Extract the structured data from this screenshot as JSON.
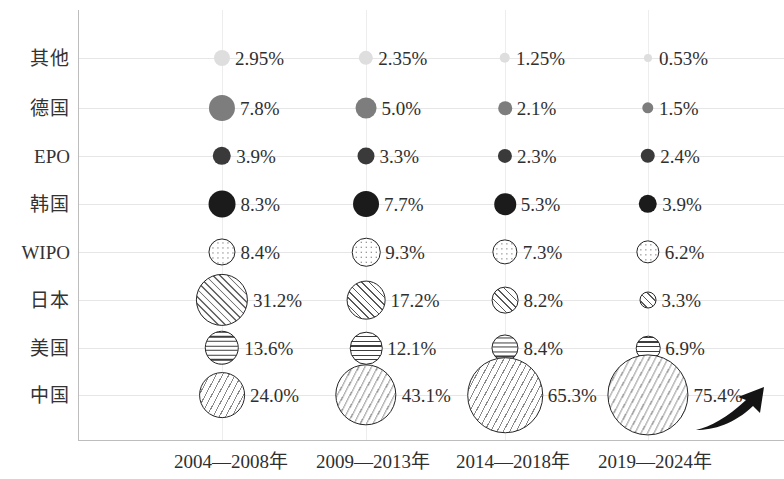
{
  "chart_data": {
    "type": "bubble",
    "title": "",
    "subtitle": "",
    "xlabel": "",
    "ylabel": "",
    "grid": true,
    "legend": "none",
    "note": "Bubble area is proportional to the share percentage; each row is a patent office / country, each column a time period.",
    "categories": [
      "2004—2008年",
      "2009—2013年",
      "2014—2018年",
      "2019—2024年"
    ],
    "rows": [
      "其他",
      "德国",
      "EPO",
      "韩国",
      "WIPO",
      "日本",
      "美国",
      "中国"
    ],
    "series": [
      {
        "name": "其他",
        "pattern": "solid-very-light",
        "color": "#dedede",
        "values": [
          2.95,
          2.35,
          1.25,
          0.53
        ],
        "labels": [
          "2.95%",
          "2.35%",
          "1.25%",
          "0.53%"
        ]
      },
      {
        "name": "德国",
        "pattern": "solid-gray",
        "color": "#7d7d7d",
        "values": [
          7.8,
          5.0,
          2.1,
          1.5
        ],
        "labels": [
          "7.8%",
          "5.0%",
          "2.1%",
          "1.5%"
        ]
      },
      {
        "name": "EPO",
        "pattern": "solid-dark",
        "color": "#3a3a3a",
        "values": [
          3.9,
          3.3,
          2.3,
          2.4
        ],
        "labels": [
          "3.9%",
          "3.3%",
          "2.3%",
          "2.4%"
        ]
      },
      {
        "name": "韩国",
        "pattern": "solid-black",
        "color": "#1b1b1b",
        "values": [
          8.3,
          7.7,
          5.3,
          3.9
        ],
        "labels": [
          "8.3%",
          "7.7%",
          "5.3%",
          "3.9%"
        ]
      },
      {
        "name": "WIPO",
        "pattern": "dots",
        "color": "#ffffff",
        "values": [
          8.4,
          9.3,
          7.3,
          6.2
        ],
        "labels": [
          "8.4%",
          "9.3%",
          "7.3%",
          "6.2%"
        ]
      },
      {
        "name": "日本",
        "pattern": "diagonal-hatch",
        "color": "#ffffff",
        "values": [
          31.2,
          17.2,
          8.2,
          3.3
        ],
        "labels": [
          "31.2%",
          "17.2%",
          "8.2%",
          "3.3%"
        ]
      },
      {
        "name": "美国",
        "pattern": "horizontal-lines",
        "color": "#ffffff",
        "values": [
          13.6,
          12.1,
          8.4,
          6.9
        ],
        "labels": [
          "13.6%",
          "12.1%",
          "8.4%",
          "6.9%"
        ]
      },
      {
        "name": "中国",
        "pattern": "dense-ticks",
        "color": "#ffffff",
        "values": [
          24.0,
          43.1,
          65.3,
          75.4
        ],
        "labels": [
          "24.0%",
          "43.1%",
          "65.3%",
          "75.4%"
        ]
      }
    ],
    "annotations": [
      {
        "name": "growth-arrow",
        "shape": "upward-curved-arrow",
        "color": "#1a1a1a"
      }
    ],
    "colors": {
      "gridline": "#e6e6e6",
      "axis": "#bdbdbd",
      "text": "#2f2f2f",
      "bubble_outline": "#242424"
    }
  },
  "axis": {
    "y_labels": [
      "其他",
      "德国",
      "EPO",
      "韩国",
      "WIPO",
      "日本",
      "美国",
      "中国"
    ],
    "x_labels": [
      "2004—2008年",
      "2009—2013年",
      "2014—2018年",
      "2019—2024年"
    ]
  }
}
